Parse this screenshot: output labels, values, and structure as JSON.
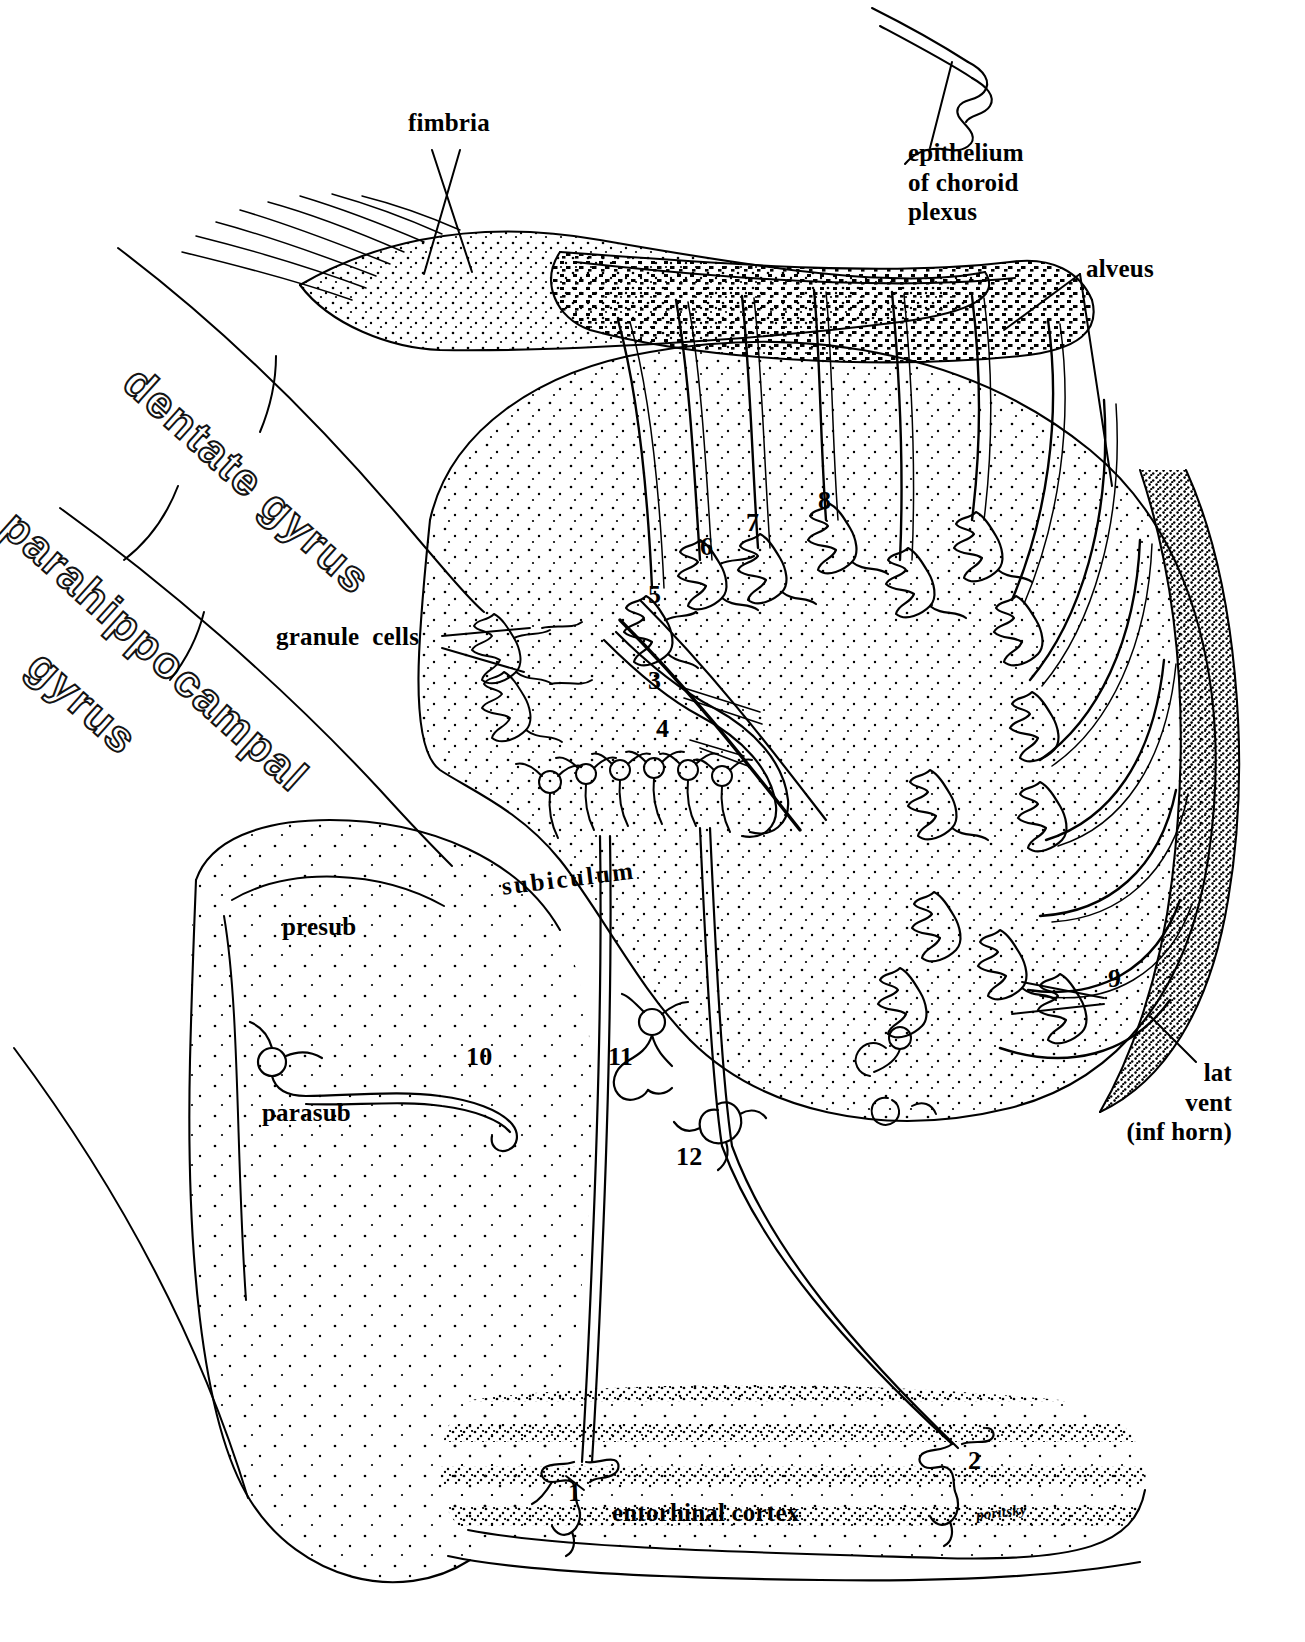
{
  "figure": {
    "signature": "poritsky",
    "ink_color": "#000000",
    "background_color": "#ffffff"
  },
  "labels": {
    "fimbria": "fimbria",
    "epithelium_choroid_plexus": "epithelium\nof choroid\nplexus",
    "alveus": "alveus",
    "dentate_gyrus": "dentate gyrus",
    "parahippocampal_line1": "parahippocampal",
    "parahippocampal_line2": "gyrus",
    "granule_cells": "granule  cells",
    "subiculum": "subiculum",
    "presub": "presub",
    "parasub": "parasub",
    "lat_vent": "lat\nvent\n(inf horn)",
    "entorhinal_cortex": "entorhinal cortex"
  },
  "numbers": [
    {
      "id": "n1",
      "text": "1"
    },
    {
      "id": "n2",
      "text": "2"
    },
    {
      "id": "n3",
      "text": "3"
    },
    {
      "id": "n4",
      "text": "4"
    },
    {
      "id": "n5",
      "text": "5"
    },
    {
      "id": "n6",
      "text": "6"
    },
    {
      "id": "n7",
      "text": "7"
    },
    {
      "id": "n8",
      "text": "8"
    },
    {
      "id": "n9",
      "text": "9"
    },
    {
      "id": "n10",
      "text": "10"
    },
    {
      "id": "n11",
      "text": "11"
    },
    {
      "id": "n12",
      "text": "12"
    }
  ]
}
